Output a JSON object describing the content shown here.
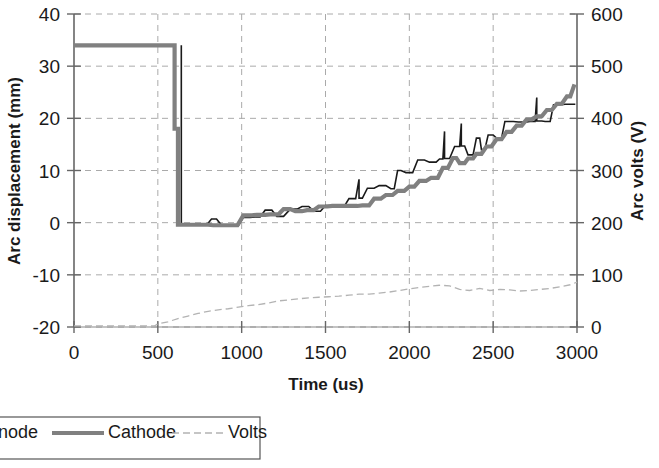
{
  "chart_data": {
    "type": "line",
    "title": "",
    "xlabel": "Time (us)",
    "ylabel": "Arc displacement (mm)",
    "y2label": "Arc volts (V)",
    "xlim": [
      0,
      3000
    ],
    "ylim": [
      -20,
      40
    ],
    "y2lim": [
      0,
      600
    ],
    "xticks": [
      0,
      500,
      1000,
      1500,
      2000,
      2500,
      3000
    ],
    "yticks": [
      -20,
      -10,
      0,
      10,
      20,
      30,
      40
    ],
    "y2ticks": [
      0,
      100,
      200,
      300,
      400,
      500,
      600
    ],
    "grid": true,
    "legend_position": "bottom-left",
    "series": [
      {
        "name": "Anode",
        "axis": "left",
        "color": "#1a1a1a",
        "style": "solid-thin",
        "points": [
          [
            640,
            34.0
          ],
          [
            640,
            -0.4
          ],
          [
            700,
            -0.4
          ],
          [
            700,
            -0.5
          ],
          [
            760,
            -0.5
          ],
          [
            790,
            -0.5
          ],
          [
            820,
            0.7
          ],
          [
            850,
            0.7
          ],
          [
            880,
            -0.5
          ],
          [
            915,
            -0.5
          ],
          [
            945,
            -0.6
          ],
          [
            980,
            -0.6
          ],
          [
            1010,
            1.0
          ],
          [
            1050,
            1.0
          ],
          [
            1080,
            1.1
          ],
          [
            1110,
            1.1
          ],
          [
            1140,
            2.4
          ],
          [
            1180,
            2.4
          ],
          [
            1210,
            1.2
          ],
          [
            1250,
            1.2
          ],
          [
            1290,
            2.6
          ],
          [
            1330,
            2.6
          ],
          [
            1360,
            3.1
          ],
          [
            1400,
            3.1
          ],
          [
            1430,
            2.2
          ],
          [
            1470,
            2.2
          ],
          [
            1500,
            3.3
          ],
          [
            1540,
            3.3
          ],
          [
            1570,
            3.0
          ],
          [
            1610,
            3.0
          ],
          [
            1640,
            4.6
          ],
          [
            1680,
            4.6
          ],
          [
            1700,
            8.3
          ],
          [
            1700,
            4.7
          ],
          [
            1720,
            4.7
          ],
          [
            1750,
            6.6
          ],
          [
            1790,
            6.6
          ],
          [
            1820,
            7.1
          ],
          [
            1860,
            7.1
          ],
          [
            1890,
            6.5
          ],
          [
            1910,
            6.5
          ],
          [
            1930,
            10.0
          ],
          [
            1950,
            10.0
          ],
          [
            1980,
            9.6
          ],
          [
            2020,
            9.6
          ],
          [
            2050,
            12.0
          ],
          [
            2090,
            12.0
          ],
          [
            2120,
            11.6
          ],
          [
            2160,
            11.6
          ],
          [
            2180,
            12.2
          ],
          [
            2200,
            12.2
          ],
          [
            2210,
            17.5
          ],
          [
            2210,
            12.3
          ],
          [
            2240,
            12.3
          ],
          [
            2270,
            14.6
          ],
          [
            2300,
            14.6
          ],
          [
            2310,
            19.0
          ],
          [
            2310,
            14.7
          ],
          [
            2330,
            14.7
          ],
          [
            2350,
            13.0
          ],
          [
            2380,
            13.0
          ],
          [
            2400,
            16.2
          ],
          [
            2420,
            16.2
          ],
          [
            2430,
            14.0
          ],
          [
            2450,
            14.0
          ],
          [
            2470,
            16.8
          ],
          [
            2500,
            16.8
          ],
          [
            2520,
            16.2
          ],
          [
            2550,
            16.2
          ],
          [
            2570,
            19.4
          ],
          [
            2620,
            19.4
          ],
          [
            2650,
            19.3
          ],
          [
            2700,
            19.3
          ],
          [
            2720,
            19.4
          ],
          [
            2750,
            19.4
          ],
          [
            2760,
            24.0
          ],
          [
            2760,
            19.5
          ],
          [
            2790,
            19.5
          ],
          [
            2810,
            19.4
          ],
          [
            2840,
            19.4
          ],
          [
            2860,
            22.6
          ],
          [
            2900,
            22.6
          ],
          [
            2930,
            22.7
          ],
          [
            2990,
            22.7
          ]
        ]
      },
      {
        "name": "Cathode",
        "axis": "left",
        "color": "#808080",
        "style": "solid-thick",
        "points": [
          [
            0,
            34.0
          ],
          [
            600,
            34.0
          ],
          [
            600,
            18.0
          ],
          [
            620,
            18.0
          ],
          [
            620,
            -0.4
          ],
          [
            700,
            -0.4
          ],
          [
            760,
            -0.4
          ],
          [
            800,
            -0.4
          ],
          [
            830,
            -0.5
          ],
          [
            870,
            -0.5
          ],
          [
            900,
            -0.5
          ],
          [
            940,
            -0.5
          ],
          [
            975,
            -0.5
          ],
          [
            1010,
            1.4
          ],
          [
            1060,
            1.4
          ],
          [
            1090,
            1.5
          ],
          [
            1140,
            1.5
          ],
          [
            1170,
            1.6
          ],
          [
            1220,
            1.6
          ],
          [
            1250,
            2.6
          ],
          [
            1290,
            2.6
          ],
          [
            1320,
            2.2
          ],
          [
            1360,
            2.2
          ],
          [
            1390,
            2.4
          ],
          [
            1430,
            2.4
          ],
          [
            1460,
            3.1
          ],
          [
            1510,
            3.1
          ],
          [
            1540,
            3.2
          ],
          [
            1600,
            3.2
          ],
          [
            1630,
            3.2
          ],
          [
            1690,
            3.2
          ],
          [
            1720,
            3.3
          ],
          [
            1760,
            3.3
          ],
          [
            1790,
            4.6
          ],
          [
            1830,
            4.6
          ],
          [
            1860,
            5.3
          ],
          [
            1900,
            5.3
          ],
          [
            1930,
            6.1
          ],
          [
            1970,
            6.1
          ],
          [
            2000,
            6.9
          ],
          [
            2030,
            6.9
          ],
          [
            2060,
            8.0
          ],
          [
            2100,
            8.0
          ],
          [
            2130,
            8.6
          ],
          [
            2170,
            8.6
          ],
          [
            2200,
            10.5
          ],
          [
            2230,
            10.5
          ],
          [
            2260,
            12.4
          ],
          [
            2280,
            12.4
          ],
          [
            2300,
            11.4
          ],
          [
            2330,
            11.4
          ],
          [
            2350,
            12.3
          ],
          [
            2380,
            12.3
          ],
          [
            2400,
            13.2
          ],
          [
            2430,
            13.2
          ],
          [
            2460,
            14.6
          ],
          [
            2490,
            14.6
          ],
          [
            2520,
            16.0
          ],
          [
            2550,
            16.0
          ],
          [
            2580,
            17.4
          ],
          [
            2610,
            17.4
          ],
          [
            2640,
            18.6
          ],
          [
            2670,
            18.6
          ],
          [
            2700,
            19.8
          ],
          [
            2730,
            19.8
          ],
          [
            2760,
            20.4
          ],
          [
            2790,
            20.4
          ],
          [
            2820,
            21.6
          ],
          [
            2850,
            21.6
          ],
          [
            2880,
            22.8
          ],
          [
            2910,
            22.8
          ],
          [
            2940,
            24.2
          ],
          [
            2960,
            24.2
          ],
          [
            2985,
            26.5
          ]
        ]
      },
      {
        "name": "Volts",
        "axis": "right",
        "color": "#b3b3b3",
        "style": "dashed-thin",
        "points": [
          [
            0,
            2
          ],
          [
            100,
            2
          ],
          [
            200,
            2
          ],
          [
            300,
            2
          ],
          [
            400,
            2
          ],
          [
            480,
            2
          ],
          [
            500,
            6
          ],
          [
            560,
            10
          ],
          [
            620,
            16
          ],
          [
            680,
            21
          ],
          [
            740,
            26
          ],
          [
            800,
            30
          ],
          [
            860,
            33
          ],
          [
            920,
            35
          ],
          [
            980,
            38
          ],
          [
            1040,
            41
          ],
          [
            1100,
            43
          ],
          [
            1160,
            46
          ],
          [
            1220,
            50
          ],
          [
            1280,
            52
          ],
          [
            1340,
            54
          ],
          [
            1400,
            56
          ],
          [
            1460,
            57
          ],
          [
            1520,
            58
          ],
          [
            1580,
            59
          ],
          [
            1640,
            61
          ],
          [
            1700,
            63
          ],
          [
            1760,
            63
          ],
          [
            1820,
            65
          ],
          [
            1880,
            67
          ],
          [
            1940,
            70
          ],
          [
            2000,
            73
          ],
          [
            2060,
            76
          ],
          [
            2120,
            78
          ],
          [
            2180,
            80
          ],
          [
            2240,
            79
          ],
          [
            2300,
            72
          ],
          [
            2360,
            70
          ],
          [
            2420,
            74
          ],
          [
            2480,
            70
          ],
          [
            2540,
            72
          ],
          [
            2600,
            71
          ],
          [
            2660,
            69
          ],
          [
            2720,
            70
          ],
          [
            2780,
            72
          ],
          [
            2840,
            74
          ],
          [
            2900,
            77
          ],
          [
            2960,
            81
          ],
          [
            3000,
            86
          ]
        ]
      }
    ]
  },
  "legend": {
    "entries": [
      {
        "label": "Anode",
        "swatch": "line-thin-black"
      },
      {
        "label": "Cathode",
        "swatch": "line-thick-gray"
      },
      {
        "label": "Volts",
        "swatch": "line-dashed-lightgray"
      }
    ]
  },
  "colors": {
    "anode": "#1a1a1a",
    "cathode": "#808080",
    "volts": "#b3b3b3",
    "grid": "#aaaaaa",
    "axis": "#555555",
    "text": "#1a1a1a"
  }
}
